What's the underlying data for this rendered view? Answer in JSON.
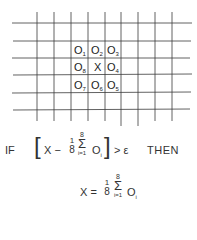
{
  "grid": {
    "line_color": "#3a3a3a",
    "vertical_x": [
      37,
      54,
      71,
      88,
      105,
      121,
      138,
      155,
      172
    ],
    "horizontal_y": [
      23,
      41,
      58,
      75,
      93,
      110
    ],
    "cells": [
      {
        "base": "O",
        "sub": "1",
        "x": 74,
        "y": 45
      },
      {
        "base": "O",
        "sub": "2",
        "x": 91,
        "y": 45
      },
      {
        "base": "O",
        "sub": "3",
        "x": 107,
        "y": 45
      },
      {
        "base": "O",
        "sub": "8",
        "x": 74,
        "y": 62
      },
      {
        "base": "X",
        "sub": "",
        "x": 94,
        "y": 62
      },
      {
        "base": "O",
        "sub": "4",
        "x": 107,
        "y": 62
      },
      {
        "base": "O",
        "sub": "7",
        "x": 74,
        "y": 80
      },
      {
        "base": "O",
        "sub": "6",
        "x": 91,
        "y": 80
      },
      {
        "base": "O",
        "sub": "5",
        "x": 107,
        "y": 80
      }
    ]
  },
  "condition": {
    "if_label": "IF",
    "open_bracket": "[",
    "lhs": "X −",
    "frac_num": "1",
    "frac_den": "8",
    "sum_upper": "8",
    "sum_symbol": "Σ",
    "sum_lower": "i=1",
    "term_base": "O",
    "term_sub": "i",
    "close_bracket": "]",
    "comparison": "> ε",
    "then_label": "THEN"
  },
  "assignment": {
    "lhs": "X =",
    "frac_num": "1",
    "frac_den": "8",
    "sum_upper": "8",
    "sum_symbol": "Σ",
    "sum_lower": "i=1",
    "term_base": "O",
    "term_sub": "i"
  }
}
